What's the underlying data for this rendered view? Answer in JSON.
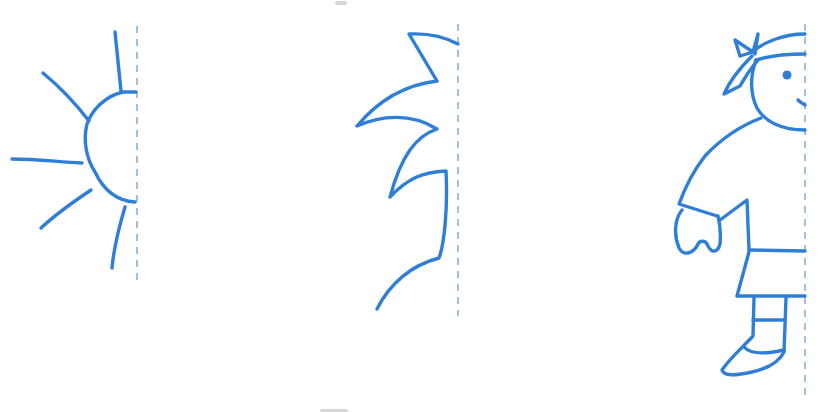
{
  "worksheet": {
    "type": "symmetry-completion-drawing",
    "colors": {
      "ink": "#2f7fd6",
      "axis": "#6f9fd0",
      "background": "#ffffff"
    },
    "figures": [
      {
        "id": "sun",
        "description": "half sun with rays",
        "axis": "dashed vertical symmetry line"
      },
      {
        "id": "tree",
        "description": "half zigzag tree / leaf outline",
        "axis": "dashed vertical symmetry line"
      },
      {
        "id": "child",
        "description": "half child with bandana, shirt, shorts and shoe",
        "axis": "dashed vertical symmetry line"
      }
    ]
  }
}
